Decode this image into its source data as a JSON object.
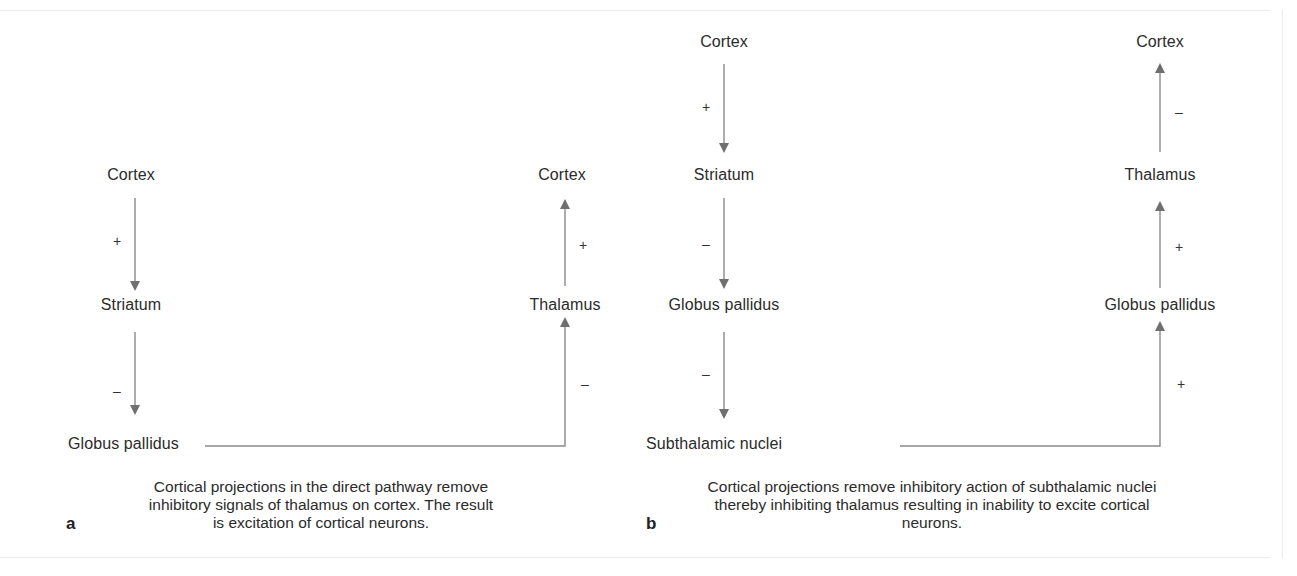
{
  "colors": {
    "text": "#2b2b2b",
    "arrow": "#6f6f6f",
    "frame": "#ececec"
  },
  "panel_a": {
    "letter": "a",
    "left_column": {
      "cortex": "Cortex",
      "striatum": "Striatum",
      "globus_pallidus": "Globus pallidus",
      "sign_cortex_to_striatum": "+",
      "sign_striatum_to_gp": "–"
    },
    "right_column": {
      "cortex": "Cortex",
      "thalamus": "Thalamus",
      "sign_thalamus_to_cortex": "+",
      "sign_gp_to_thalamus": "–"
    },
    "caption": {
      "line1": "Cortical projections in the direct pathway remove",
      "line2": "inhibitory signals of thalamus on cortex. The result",
      "line3": "is excitation of cortical neurons."
    }
  },
  "panel_b": {
    "letter": "b",
    "left_column": {
      "cortex": "Cortex",
      "striatum": "Striatum",
      "globus_pallidus": "Globus pallidus",
      "subthalamic_nuclei": "Subthalamic nuclei",
      "sign_cortex_to_striatum": "+",
      "sign_striatum_to_gp": "–",
      "sign_gp_to_stn": "–"
    },
    "right_column": {
      "cortex": "Cortex",
      "thalamus": "Thalamus",
      "globus_pallidus": "Globus pallidus",
      "sign_thalamus_to_cortex": "–",
      "sign_gp_to_thalamus": "+",
      "sign_stn_to_gp": "+"
    },
    "caption": {
      "line1": "Cortical projections remove inhibitory action of subthalamic nuclei",
      "line2": "thereby inhibiting thalamus resulting in inability to excite cortical",
      "line3": "neurons."
    }
  }
}
